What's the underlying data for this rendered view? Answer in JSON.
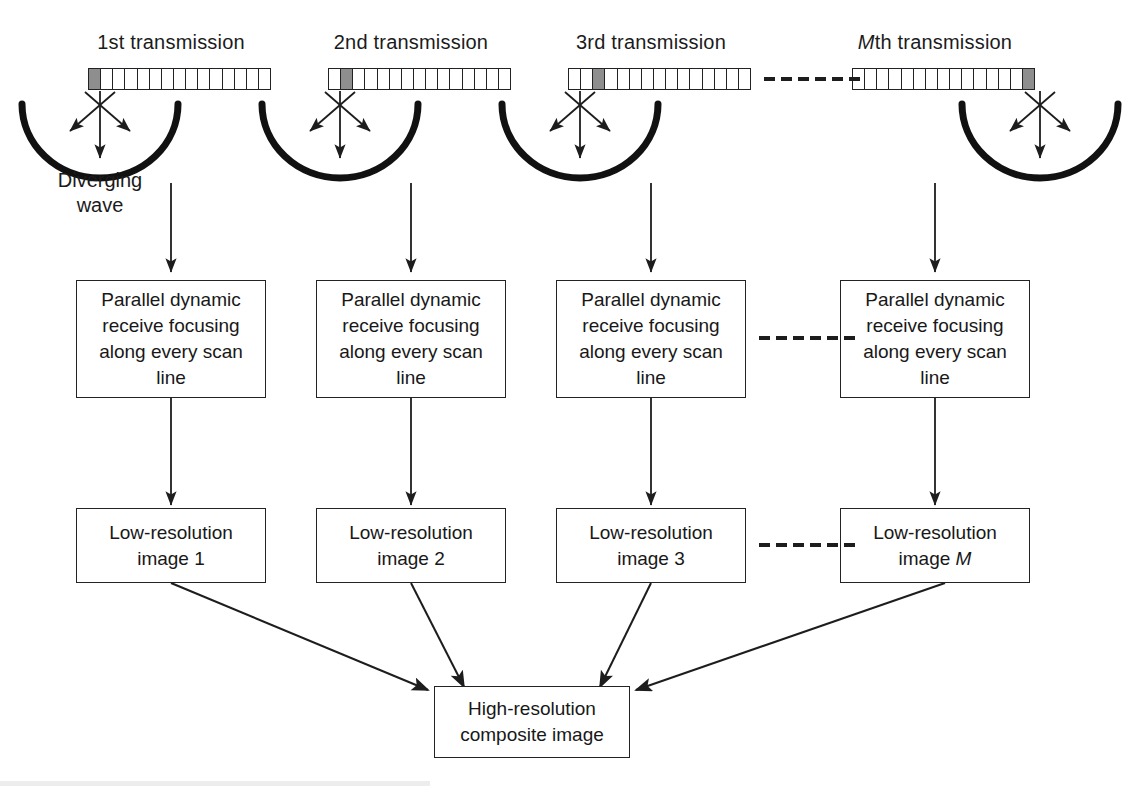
{
  "figure": {
    "background_color": "#ffffff",
    "ink_color": "#1b1b1b",
    "active_element_color": "#8e8e8e"
  },
  "columns": [
    {
      "id": "col1",
      "title_prefix": "1st",
      "title_suffix": " transmission",
      "title_italic_prefix": false,
      "array": {
        "cells": 15,
        "active_index": 0
      },
      "wave_label_line1": "Diverging",
      "wave_label_line2": "wave",
      "process_box": {
        "line1": "Parallel dynamic",
        "line2": "receive focusing",
        "line3": "along every scan line"
      },
      "image_box": {
        "line1": "Low-resolution",
        "line2_prefix": "image ",
        "line2_index": "1",
        "line2_italic": false
      }
    },
    {
      "id": "col2",
      "title_prefix": "2nd",
      "title_suffix": " transmission",
      "title_italic_prefix": false,
      "array": {
        "cells": 15,
        "active_index": 1
      },
      "wave_label_line1": "",
      "wave_label_line2": "",
      "process_box": {
        "line1": "Parallel dynamic",
        "line2": "receive focusing",
        "line3": "along every scan line"
      },
      "image_box": {
        "line1": "Low-resolution",
        "line2_prefix": "image ",
        "line2_index": "2",
        "line2_italic": false
      }
    },
    {
      "id": "col3",
      "title_prefix": "3rd",
      "title_suffix": " transmission",
      "title_italic_prefix": false,
      "array": {
        "cells": 15,
        "active_index": 2
      },
      "wave_label_line1": "",
      "wave_label_line2": "",
      "process_box": {
        "line1": "Parallel dynamic",
        "line2": "receive focusing",
        "line3": "along every scan line"
      },
      "image_box": {
        "line1": "Low-resolution",
        "line2_prefix": "image ",
        "line2_index": "3",
        "line2_italic": false
      }
    },
    {
      "id": "colM",
      "title_prefix": "M",
      "title_suffix": "th transmission",
      "title_italic_prefix": true,
      "array": {
        "cells": 15,
        "active_index": 14
      },
      "wave_label_line1": "",
      "wave_label_line2": "",
      "process_box": {
        "line1": "Parallel dynamic",
        "line2": "receive focusing",
        "line3": "along every scan line"
      },
      "image_box": {
        "line1": "Low-resolution",
        "line2_prefix": "image ",
        "line2_index": "M",
        "line2_italic": true
      }
    }
  ],
  "ellipsis": {
    "dash_count": 6,
    "rows": [
      "array-row",
      "process-row",
      "image-row"
    ]
  },
  "final_box": {
    "line1": "High-resolution",
    "line2": "composite image"
  }
}
